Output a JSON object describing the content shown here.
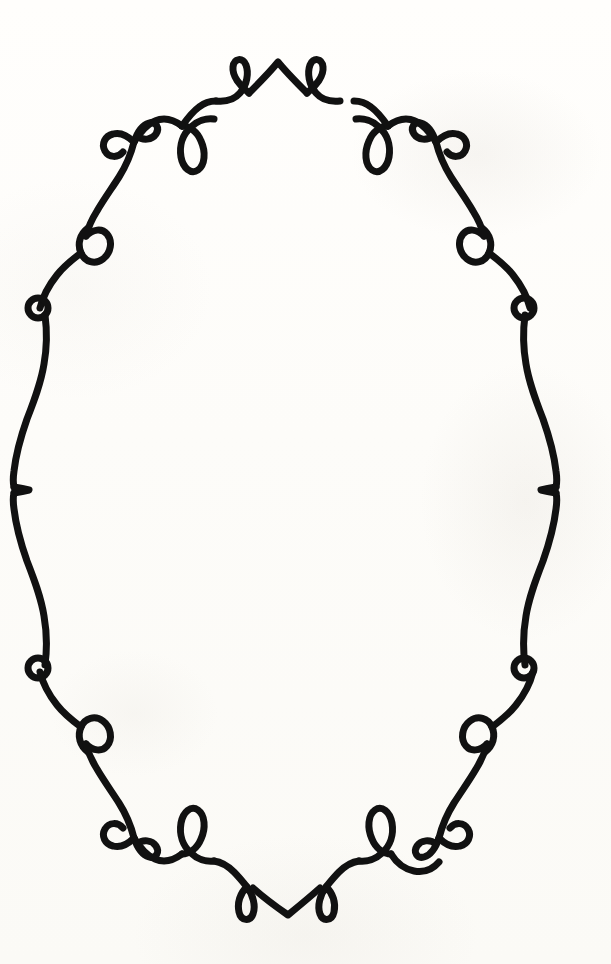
{
  "artwork": {
    "title": "Decorative Oval Flourish Frame",
    "description": "Hand-drawn black ink ornamental oval border with scrolls, loops and curls on off-white paper",
    "style": "calligraphic flourish / wrought-iron scrollwork",
    "symmetry": "bilateral left-right and top-bottom",
    "canvas": {
      "width": 611,
      "height": 964
    },
    "colors": {
      "ink": "#111111",
      "background": "#fdfcfa",
      "paper_tint": "#fbfaf6"
    },
    "stroke": {
      "width_main": 7,
      "width_thin": 6,
      "linecap": "round"
    },
    "interior": {
      "empty": true,
      "text": ""
    },
    "geometry": {
      "center_x": 305,
      "center_y": 489,
      "top_apex_y": 62,
      "bottom_apex_y": 915,
      "left_edge_x": 13,
      "right_edge_x": 557
    },
    "motifs": [
      {
        "name": "top-center-peak",
        "label": "Top center peak",
        "x": 278,
        "y": 62
      },
      {
        "name": "top-inner-loop-left",
        "label": "Top inner upward teardrop loop (left)",
        "x": 239,
        "y": 68
      },
      {
        "name": "top-inner-loop-right",
        "label": "Top inner upward teardrop loop (right)",
        "x": 315,
        "y": 68
      },
      {
        "name": "top-hanging-loop-left",
        "label": "Top hanging teardrop loop (left)",
        "x": 196,
        "y": 140
      },
      {
        "name": "top-hanging-loop-right",
        "label": "Top hanging teardrop loop (right)",
        "x": 367,
        "y": 140
      },
      {
        "name": "corner-scurl-top-left",
        "label": "Upper-left S-curl double spiral",
        "x": 115,
        "y": 145
      },
      {
        "name": "corner-scurl-top-right",
        "label": "Upper-right S-curl double spiral",
        "x": 445,
        "y": 145
      },
      {
        "name": "corner-loop-top-left",
        "label": "Upper-left teardrop loop",
        "x": 88,
        "y": 237
      },
      {
        "name": "corner-loop-top-right",
        "label": "Upper-right teardrop loop",
        "x": 478,
        "y": 237
      },
      {
        "name": "side-ring-upper-left",
        "label": "Upper-left small closed ring",
        "x": 38,
        "y": 308
      },
      {
        "name": "side-ring-upper-right",
        "label": "Upper-right small closed ring",
        "x": 524,
        "y": 308
      },
      {
        "name": "side-cusp-left",
        "label": "Left mid-height inward cusp",
        "x": 14,
        "y": 487
      },
      {
        "name": "side-cusp-right",
        "label": "Right mid-height inward cusp",
        "x": 556,
        "y": 487
      },
      {
        "name": "side-ring-lower-left",
        "label": "Lower-left small closed ring",
        "x": 38,
        "y": 668
      },
      {
        "name": "side-ring-lower-right",
        "label": "Lower-right small closed ring",
        "x": 524,
        "y": 668
      },
      {
        "name": "corner-loop-bottom-left",
        "label": "Lower-left teardrop loop",
        "x": 88,
        "y": 742
      },
      {
        "name": "corner-loop-bottom-right",
        "label": "Lower-right teardrop loop",
        "x": 478,
        "y": 742
      },
      {
        "name": "corner-scurl-bottom-left",
        "label": "Lower-left S-curl double spiral",
        "x": 115,
        "y": 834
      },
      {
        "name": "corner-scurl-bottom-right",
        "label": "Lower-right S-curl double spiral",
        "x": 445,
        "y": 834
      },
      {
        "name": "bottom-hanging-loop-left",
        "label": "Bottom teardrop loop (left)",
        "x": 196,
        "y": 845
      },
      {
        "name": "bottom-hanging-loop-right",
        "label": "Bottom teardrop loop (right)",
        "x": 367,
        "y": 845
      },
      {
        "name": "bottom-inner-loop-left",
        "label": "Bottom inner downward teardrop loop (left)",
        "x": 247,
        "y": 905
      },
      {
        "name": "bottom-inner-loop-right",
        "label": "Bottom inner downward teardrop loop (right)",
        "x": 322,
        "y": 905
      },
      {
        "name": "bottom-center-valley",
        "label": "Bottom center valley point",
        "x": 288,
        "y": 915
      }
    ]
  }
}
